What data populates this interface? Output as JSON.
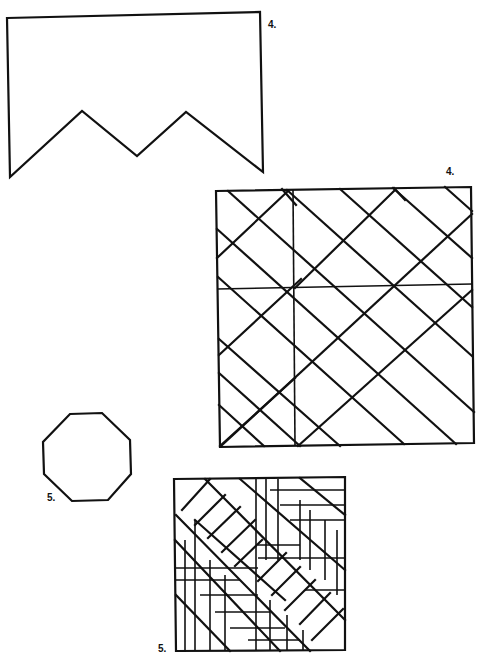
{
  "labels": {
    "banner_shape": "4.",
    "diagonal_grid": "4.",
    "octagon": "5.",
    "chevron_pattern": "5."
  },
  "colors": {
    "background": "#ffffff",
    "ink": "#111111"
  },
  "figures": [
    {
      "id": "banner_shape",
      "type": "polygon",
      "label": "4."
    },
    {
      "id": "diagonal_grid",
      "type": "line-pattern",
      "label": "4."
    },
    {
      "id": "octagon",
      "type": "polygon",
      "label": "5."
    },
    {
      "id": "chevron_pattern",
      "type": "line-pattern",
      "label": "5."
    }
  ]
}
